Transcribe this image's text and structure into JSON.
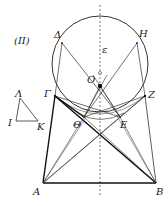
{
  "figure_label": "(II)",
  "points": {
    "Delta": "Δ",
    "H": "H",
    "epsilon": "ε",
    "O": "O",
    "Gamma": "Γ",
    "Z": "Z",
    "Theta": "Θ",
    "E": "E",
    "A": "A",
    "B": "B",
    "Lambda": "Λ",
    "I": "I",
    "K": "K"
  },
  "colors": {
    "stroke": "#333333",
    "thick": "#111111",
    "dashed": "#555555"
  }
}
